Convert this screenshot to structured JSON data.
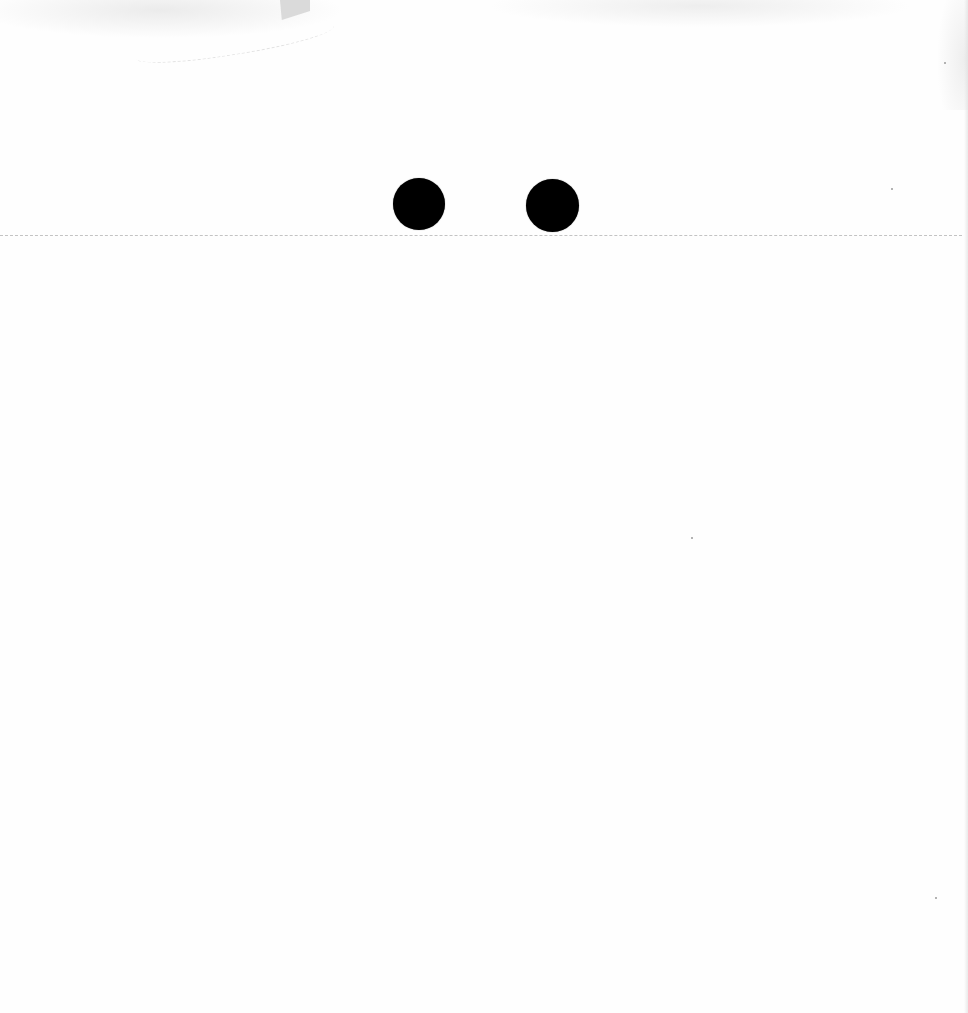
{
  "page": {
    "background_color": "#fefefe",
    "text_content": []
  },
  "punch_holes": [
    {
      "id": "left",
      "cx": 419,
      "cy": 204,
      "diameter": 52,
      "color": "#000000"
    },
    {
      "id": "right",
      "cx": 552,
      "cy": 205,
      "diameter": 53,
      "color": "#000000"
    }
  ],
  "fold_line": {
    "y": 235,
    "style": "dashed",
    "color": "#b9b9b9"
  },
  "specks": [
    {
      "x": 944,
      "y": 62
    },
    {
      "x": 891,
      "y": 188
    },
    {
      "x": 691,
      "y": 537
    },
    {
      "x": 935,
      "y": 897
    }
  ]
}
